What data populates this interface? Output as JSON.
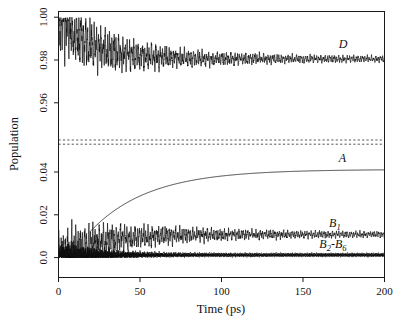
{
  "chart_data": {
    "type": "line",
    "title": "",
    "xlabel": "Time (ps)",
    "ylabel": "Population",
    "xlim": [
      0,
      200
    ],
    "x_ticks": [
      0,
      50,
      100,
      150,
      200
    ],
    "x_tick_labels": [
      "0",
      "50",
      "100",
      "150",
      "200"
    ],
    "y_tick_labels": [
      "1.00",
      "0.98",
      "0.96",
      "0.04",
      "0.02",
      "0.0"
    ],
    "y_tick_values": [
      1.0,
      0.98,
      0.96,
      0.04,
      0.02,
      0.0
    ],
    "y_axis_broken": true,
    "y_break_between": [
      0.0425,
      0.955
    ],
    "grid": false,
    "legend_position": "inline-right",
    "annotations": [
      {
        "label": "D",
        "x": 172,
        "y": 0.9855
      },
      {
        "label": "A",
        "x": 172,
        "y": 0.0447
      },
      {
        "label": "B",
        "sub": "1",
        "x": 166,
        "y": 0.0142
      },
      {
        "label": "B",
        "sub": "2",
        "label2": "-B",
        "sub2": "6",
        "x": 160,
        "y": 0.0045
      }
    ],
    "series": [
      {
        "name": "D",
        "style": "oscillating-damped",
        "start_value": 1.0,
        "asymptote": 0.9805,
        "initial_amplitude": 0.0145,
        "damping_time_ps": 46,
        "residual_amplitude": 0.0012,
        "period_ps": 1.35,
        "description": "Donor population decays from 1.00 with strongly damped coherent oscillations to a plateau near 0.980"
      },
      {
        "name": "A",
        "style": "smooth-rise",
        "start_value": 0.0118,
        "start_time_ps": 19,
        "asymptote": 0.0412,
        "rise_time_ps": 36,
        "description": "Acceptor population rises smoothly and saturates near 0.041"
      },
      {
        "name": "B1",
        "style": "oscillating-damped",
        "start_value": 0.0,
        "asymptote": 0.0108,
        "initial_amplitude": 0.0098,
        "damping_time_ps": 52,
        "residual_amplitude": 0.0011,
        "period_ps": 1.3,
        "description": "Bridge site 1 population oscillates about 0.011"
      },
      {
        "name": "B2-B6",
        "style": "oscillating-damped-low",
        "start_value": 0.0,
        "asymptote": 0.0012,
        "initial_amplitude": 0.006,
        "damping_time_ps": 22,
        "residual_amplitude": 0.0004,
        "period_ps": 1.25,
        "description": "Bridge sites 2 through 6 populations remain near zero"
      }
    ],
    "break_markers": {
      "count": 2,
      "style": "dashed",
      "y_positions": [
        0.0438,
        0.0462
      ],
      "color": "#555555"
    }
  }
}
